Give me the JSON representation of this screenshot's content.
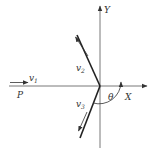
{
  "diagram": {
    "labels": {
      "y_axis": "Y",
      "x_axis": "X",
      "point": "P",
      "v1": "v",
      "v1_sub": "1",
      "v2": "v",
      "v2_sub": "2",
      "v3": "v",
      "v3_sub": "3",
      "angle": "θ"
    },
    "colors": {
      "line": "#444444",
      "thick_line": "#222222",
      "text": "#333333"
    }
  }
}
